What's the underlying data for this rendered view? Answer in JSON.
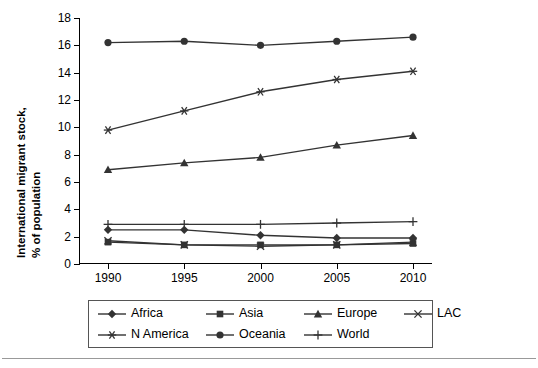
{
  "chart_data": {
    "type": "line",
    "title": "",
    "xlabel": "",
    "ylabel": "International migrant stock, % of population",
    "ylabel_line1": "International migrant stock,",
    "ylabel_line2": "% of population",
    "categories": [
      "1990",
      "1995",
      "2000",
      "2005",
      "2010"
    ],
    "x": [
      1990,
      1995,
      2000,
      2005,
      2010
    ],
    "ylim": [
      0,
      18
    ],
    "yticks": [
      0,
      2,
      4,
      6,
      8,
      10,
      12,
      14,
      16,
      18
    ],
    "ytick_labels": [
      "0",
      "2",
      "4",
      "6",
      "8",
      "10",
      "12",
      "14",
      "16",
      "18"
    ],
    "grid": false,
    "legend_position": "bottom",
    "series": [
      {
        "name": "Africa",
        "marker": "diamond",
        "values": [
          2.5,
          2.5,
          2.1,
          1.9,
          1.9
        ]
      },
      {
        "name": "Asia",
        "marker": "square",
        "values": [
          1.6,
          1.4,
          1.4,
          1.4,
          1.5
        ]
      },
      {
        "name": "Europe",
        "marker": "triangle",
        "values": [
          6.9,
          7.4,
          7.8,
          8.7,
          9.4
        ]
      },
      {
        "name": "LAC",
        "marker": "cross-x",
        "values": [
          1.7,
          1.4,
          1.3,
          1.4,
          1.6
        ]
      },
      {
        "name": "N America",
        "marker": "asterisk",
        "values": [
          9.8,
          11.2,
          12.6,
          13.5,
          14.1
        ]
      },
      {
        "name": "Oceania",
        "marker": "circle",
        "values": [
          16.2,
          16.3,
          16.0,
          16.3,
          16.6
        ]
      },
      {
        "name": "World",
        "marker": "plus",
        "values": [
          2.9,
          2.9,
          2.9,
          3.0,
          3.1
        ]
      }
    ]
  },
  "legend": {
    "items": [
      {
        "label": "Africa",
        "symbol": "diamond-marker-icon"
      },
      {
        "label": "Asia",
        "symbol": "square-marker-icon"
      },
      {
        "label": "Europe",
        "symbol": "triangle-marker-icon"
      },
      {
        "label": "LAC",
        "symbol": "x-marker-icon"
      },
      {
        "label": "N America",
        "symbol": "asterisk-marker-icon"
      },
      {
        "label": "Oceania",
        "symbol": "circle-marker-icon"
      },
      {
        "label": "World",
        "symbol": "plus-marker-icon"
      }
    ]
  },
  "colors": {
    "line": "#333333",
    "axis": "#000000",
    "background": "#ffffff",
    "legend_border": "#555555"
  }
}
